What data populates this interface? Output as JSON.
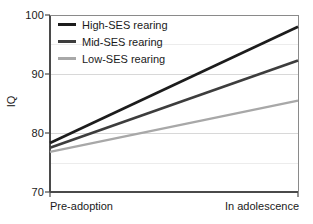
{
  "chart_data": {
    "type": "line",
    "title": "",
    "xlabel": "",
    "ylabel": "IQ",
    "x": [
      "Pre-adoption",
      "In adolescence"
    ],
    "xtick_labels": [
      "Pre-adoption",
      "In adolescence"
    ],
    "ytick_labels": [
      "70",
      "80",
      "90",
      "100"
    ],
    "yticks": [
      70,
      80,
      90,
      100
    ],
    "ylim": [
      70,
      100
    ],
    "grid": "horizontal",
    "legend_position": "top-left",
    "series": [
      {
        "name": "High-SES rearing",
        "values": [
          78.3,
          98.0
        ],
        "color": "#1c1c1c",
        "width": 2.6
      },
      {
        "name": "Mid-SES rearing",
        "values": [
          77.5,
          92.3
        ],
        "color": "#3d3d3d",
        "width": 2.6
      },
      {
        "name": "Low-SES rearing",
        "values": [
          76.8,
          85.5
        ],
        "color": "#a8a8a8",
        "width": 2.2
      }
    ]
  },
  "axes": {
    "y_label": "IQ",
    "y_ticks": [
      "100",
      "90",
      "80",
      "70"
    ],
    "x_tick_left": "Pre-adoption",
    "x_tick_right": "In adolescence"
  },
  "legend": {
    "entries": [
      {
        "label": "High-SES rearing",
        "color": "#1c1c1c"
      },
      {
        "label": "Mid-SES rearing",
        "color": "#3d3d3d"
      },
      {
        "label": "Low-SES rearing",
        "color": "#a8a8a8"
      }
    ]
  },
  "style": {
    "background": "#ffffff",
    "axis_color": "#4a4a4a",
    "grid_color": "#d8d8d8",
    "text_color": "#1a1a1a"
  }
}
